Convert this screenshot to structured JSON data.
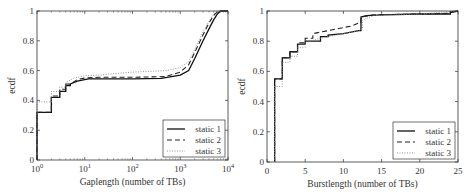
{
  "chart_data": [
    {
      "type": "line",
      "subtype": "ecdf-step",
      "xscale": "log",
      "xlabel": "Gaplength (number of TBs)",
      "ylabel": "ecdf",
      "xlim": [
        1,
        10000
      ],
      "ylim": [
        0,
        1
      ],
      "xticks": [
        1,
        10,
        100,
        1000,
        10000
      ],
      "xtick_labels": [
        "10^0",
        "10^1",
        "10^2",
        "10^3",
        "10^4"
      ],
      "yticks": [
        0,
        0.2,
        0.4,
        0.6,
        0.8,
        1
      ],
      "ytick_labels": [
        "0",
        "0.2",
        "0.4",
        "0.6",
        "0.8",
        "1"
      ],
      "grid": false,
      "legend_position": "lower right",
      "series": [
        {
          "name": "static 1",
          "style": "solid",
          "points": [
            [
              1,
              0
            ],
            [
              1,
              0.32
            ],
            [
              2,
              0.32
            ],
            [
              2,
              0.42
            ],
            [
              3,
              0.42
            ],
            [
              3,
              0.46
            ],
            [
              4,
              0.46
            ],
            [
              4,
              0.5
            ],
            [
              5,
              0.5
            ],
            [
              5,
              0.51
            ],
            [
              7,
              0.53
            ],
            [
              10,
              0.54
            ],
            [
              12,
              0.545
            ],
            [
              100,
              0.545
            ],
            [
              400,
              0.548
            ],
            [
              1000,
              0.57
            ],
            [
              1500,
              0.6
            ],
            [
              2000,
              0.68
            ],
            [
              3000,
              0.8
            ],
            [
              4000,
              0.88
            ],
            [
              5000,
              0.94
            ],
            [
              6000,
              0.98
            ],
            [
              7000,
              1.0
            ],
            [
              10000,
              1.0
            ]
          ]
        },
        {
          "name": "static 2",
          "style": "dashed",
          "points": [
            [
              1,
              0
            ],
            [
              1,
              0.32
            ],
            [
              2,
              0.32
            ],
            [
              2,
              0.43
            ],
            [
              3,
              0.43
            ],
            [
              3,
              0.475
            ],
            [
              4,
              0.475
            ],
            [
              4,
              0.51
            ],
            [
              5,
              0.51
            ],
            [
              7,
              0.54
            ],
            [
              10,
              0.55
            ],
            [
              20,
              0.555
            ],
            [
              100,
              0.555
            ],
            [
              500,
              0.56
            ],
            [
              1000,
              0.59
            ],
            [
              1500,
              0.64
            ],
            [
              2000,
              0.72
            ],
            [
              3000,
              0.84
            ],
            [
              4000,
              0.92
            ],
            [
              5000,
              0.97
            ],
            [
              6000,
              0.995
            ],
            [
              7000,
              1.0
            ],
            [
              10000,
              1.0
            ]
          ]
        },
        {
          "name": "static 3",
          "style": "dotted",
          "points": [
            [
              1,
              0
            ],
            [
              1,
              0.39
            ],
            [
              2,
              0.39
            ],
            [
              2,
              0.46
            ],
            [
              3,
              0.46
            ],
            [
              3,
              0.49
            ],
            [
              4,
              0.49
            ],
            [
              4,
              0.52
            ],
            [
              6,
              0.55
            ],
            [
              10,
              0.565
            ],
            [
              20,
              0.57
            ],
            [
              100,
              0.59
            ],
            [
              500,
              0.6
            ],
            [
              1000,
              0.62
            ],
            [
              1500,
              0.66
            ],
            [
              2000,
              0.74
            ],
            [
              3000,
              0.86
            ],
            [
              4000,
              0.93
            ],
            [
              5000,
              0.98
            ],
            [
              6000,
              1.0
            ],
            [
              10000,
              1.0
            ]
          ]
        }
      ],
      "plot_box_px": {
        "left": 37,
        "right": 228,
        "top": 11,
        "bottom": 160
      }
    },
    {
      "type": "line",
      "subtype": "ecdf-step",
      "xscale": "linear",
      "xlabel": "Burstlength (number of TBs)",
      "ylabel": "ecdf",
      "xlim": [
        0,
        25
      ],
      "ylim": [
        0,
        1
      ],
      "xticks": [
        0,
        5,
        10,
        15,
        20,
        25
      ],
      "xtick_labels": [
        "0",
        "5",
        "10",
        "15",
        "20",
        "25"
      ],
      "yticks": [
        0,
        0.2,
        0.4,
        0.6,
        0.8,
        1
      ],
      "ytick_labels": [
        "0",
        "0.2",
        "0.4",
        "0.6",
        "0.8",
        "1"
      ],
      "grid": false,
      "legend_position": "lower right",
      "series": [
        {
          "name": "static 1",
          "style": "solid",
          "points": [
            [
              1,
              0
            ],
            [
              1,
              0.55
            ],
            [
              2,
              0.55
            ],
            [
              2,
              0.69
            ],
            [
              3,
              0.69
            ],
            [
              3,
              0.73
            ],
            [
              4,
              0.73
            ],
            [
              4,
              0.78
            ],
            [
              5,
              0.78
            ],
            [
              5,
              0.8
            ],
            [
              7,
              0.8
            ],
            [
              7,
              0.83
            ],
            [
              8,
              0.83
            ],
            [
              8,
              0.84
            ],
            [
              10,
              0.85
            ],
            [
              12,
              0.87
            ],
            [
              12.3,
              0.87
            ],
            [
              12.3,
              0.96
            ],
            [
              13,
              0.97
            ],
            [
              15,
              0.975
            ],
            [
              20,
              0.98
            ],
            [
              24,
              0.98
            ],
            [
              24,
              0.99
            ],
            [
              25,
              1.0
            ]
          ]
        },
        {
          "name": "static 2",
          "style": "dashed",
          "points": [
            [
              1,
              0
            ],
            [
              1,
              0.55
            ],
            [
              2,
              0.55
            ],
            [
              2,
              0.69
            ],
            [
              3,
              0.69
            ],
            [
              3,
              0.73
            ],
            [
              4,
              0.73
            ],
            [
              4,
              0.79
            ],
            [
              5,
              0.79
            ],
            [
              5,
              0.82
            ],
            [
              6,
              0.82
            ],
            [
              6,
              0.85
            ],
            [
              8,
              0.87
            ],
            [
              10,
              0.89
            ],
            [
              11,
              0.9
            ],
            [
              12,
              0.92
            ],
            [
              12.3,
              0.92
            ],
            [
              12.3,
              0.96
            ],
            [
              14,
              0.975
            ],
            [
              20,
              0.98
            ],
            [
              24,
              0.985
            ],
            [
              24,
              0.995
            ],
            [
              25,
              1.0
            ]
          ]
        },
        {
          "name": "static 3",
          "style": "dotted",
          "points": [
            [
              1,
              0
            ],
            [
              1,
              0.5
            ],
            [
              2,
              0.5
            ],
            [
              2,
              0.66
            ],
            [
              3,
              0.66
            ],
            [
              3,
              0.7
            ],
            [
              4,
              0.7
            ],
            [
              4,
              0.76
            ],
            [
              5,
              0.76
            ],
            [
              5,
              0.79
            ],
            [
              7,
              0.82
            ],
            [
              10,
              0.85
            ],
            [
              12,
              0.87
            ],
            [
              12.5,
              0.88
            ],
            [
              12.5,
              0.94
            ],
            [
              14,
              0.97
            ],
            [
              20,
              0.98
            ],
            [
              25,
              1.0
            ]
          ]
        }
      ],
      "plot_box_px": {
        "left": 267,
        "right": 458,
        "top": 11,
        "bottom": 162
      }
    }
  ]
}
